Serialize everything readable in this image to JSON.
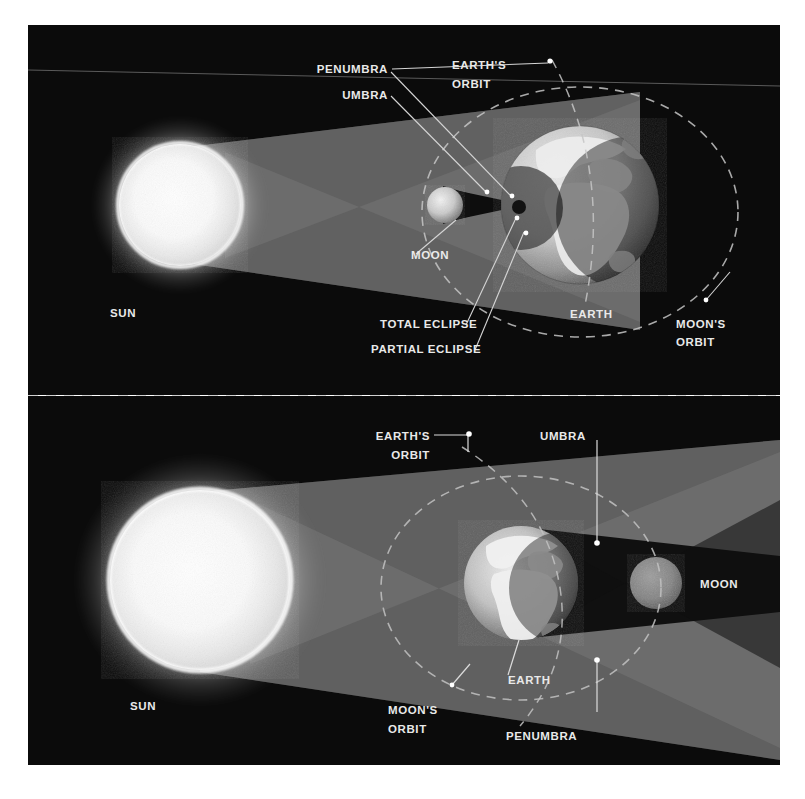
{
  "figure": {
    "background_color": "#ffffff",
    "sky_color": "#0c0c0c",
    "label_color": "#e9e9e9",
    "leader_color": "#cfcfcf",
    "orbit_color": "#b9b9b9",
    "light_cone_color": "#7d7d7d",
    "umbra_color": "#111111",
    "sun_color": "#ffffff",
    "earth_color": "#cfcfcf",
    "moon_color": "#9a9a9a"
  },
  "panels": [
    {
      "id": "solar-eclipse",
      "name": "Solar eclipse panel (top)",
      "bodies": [
        {
          "name": "sun",
          "label": "SUN"
        },
        {
          "name": "moon",
          "label": "MOON"
        },
        {
          "name": "earth",
          "label": "EARTH"
        }
      ],
      "labels": [
        {
          "name": "penumbra",
          "text": "PENUMBRA"
        },
        {
          "name": "umbra",
          "text": "UMBRA"
        },
        {
          "name": "earths-orbit",
          "line1": "EARTH'S",
          "line2": "ORBIT"
        },
        {
          "name": "moon",
          "text": "MOON"
        },
        {
          "name": "sun",
          "text": "SUN"
        },
        {
          "name": "earth",
          "text": "EARTH"
        },
        {
          "name": "total-eclipse",
          "text": "TOTAL ECLIPSE"
        },
        {
          "name": "partial-eclipse",
          "text": "PARTIAL ECLIPSE"
        },
        {
          "name": "moons-orbit",
          "line1": "MOON'S",
          "line2": "ORBIT"
        }
      ]
    },
    {
      "id": "lunar-eclipse",
      "name": "Lunar eclipse panel (bottom)",
      "bodies": [
        {
          "name": "sun",
          "label": "SUN"
        },
        {
          "name": "earth",
          "label": "EARTH"
        },
        {
          "name": "moon",
          "label": "MOON"
        }
      ],
      "labels": [
        {
          "name": "earths-orbit",
          "line1": "EARTH'S",
          "line2": "ORBIT"
        },
        {
          "name": "umbra",
          "text": "UMBRA"
        },
        {
          "name": "moon",
          "text": "MOON"
        },
        {
          "name": "sun",
          "text": "SUN"
        },
        {
          "name": "earth",
          "text": "EARTH"
        },
        {
          "name": "moons-orbit",
          "line1": "MOON'S",
          "line2": "ORBIT"
        },
        {
          "name": "penumbra",
          "text": "PENUMBRA"
        }
      ]
    }
  ]
}
